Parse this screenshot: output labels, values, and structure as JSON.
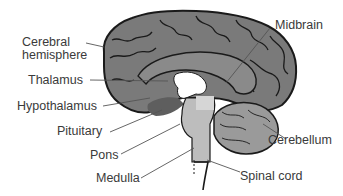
{
  "diagram": {
    "colors": {
      "cortex": "#7a7a7a",
      "outline": "#1a1a1a",
      "brainstem": "#bdbdbd",
      "cerebellum": "#9a9a9a",
      "ventricle": "#ffffff",
      "leader_line": "#555555",
      "label_text": "#3a3a3a"
    },
    "labels": {
      "cerebral_hemisphere_1": "Cerebral",
      "cerebral_hemisphere_2": "hemisphere",
      "thalamus": "Thalamus",
      "hypothalamus": "Hypothalamus",
      "pituitary": "Pituitary",
      "pons": "Pons",
      "medulla": "Medulla",
      "midbrain": "Midbrain",
      "cerebellum": "Cerebellum",
      "spinal_cord": "Spinal cord"
    }
  }
}
